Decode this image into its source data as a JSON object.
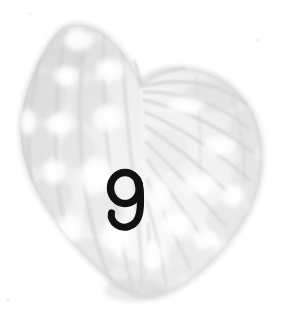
{
  "canvas": {
    "width": 286,
    "height": 316,
    "background_color": "#ffffff",
    "medium": "pencil-watercolor-sketch",
    "subject_name": "butterfly-wing-pair"
  },
  "artwork": {
    "title": "",
    "silhouette_label": "heart-shaped wing pair",
    "outline_color": "#cfcfcf",
    "wash_color": "#e9e9e9",
    "vein_color": "#c8c8c8",
    "highlight_color": "#ffffff",
    "left_wing_label": "left-wing-with-pale-spots",
    "right_wing_label": "right-wing-with-radiating-veins",
    "notch_label": "wing-notch",
    "bottom_tip_label": "wing-bottom-tip",
    "bounds": {
      "left": 18,
      "top": 20,
      "right": 266,
      "bottom": 300
    }
  },
  "overlay": {
    "digit": "9",
    "digit_label": "handwritten-digit-nine",
    "digit_color": "#111111",
    "digit_x": 110,
    "digit_y": 172,
    "digit_width": 32,
    "digit_height": 58,
    "style": "handwritten script, oval bowl with curved left-hooking descender"
  },
  "chart_data": {
    "type": "table",
    "title": "",
    "categories": [
      "left-wing-spots",
      "right-wing-veins"
    ],
    "values": [
      8,
      11
    ]
  }
}
